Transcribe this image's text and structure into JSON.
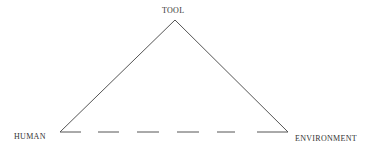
{
  "diagram": {
    "type": "triangle",
    "nodes": [
      {
        "id": "tool",
        "label": "TOOL",
        "position": "top"
      },
      {
        "id": "human",
        "label": "HUMAN",
        "position": "bottom-left"
      },
      {
        "id": "environment",
        "label": "ENVIRONMENT",
        "position": "bottom-right"
      }
    ],
    "edges": [
      {
        "from": "human",
        "to": "tool",
        "style": "solid"
      },
      {
        "from": "tool",
        "to": "environment",
        "style": "solid"
      },
      {
        "from": "human",
        "to": "environment",
        "style": "dashed"
      }
    ],
    "colors": {
      "line": "#555555",
      "text": "#333333",
      "background": "#ffffff"
    }
  }
}
